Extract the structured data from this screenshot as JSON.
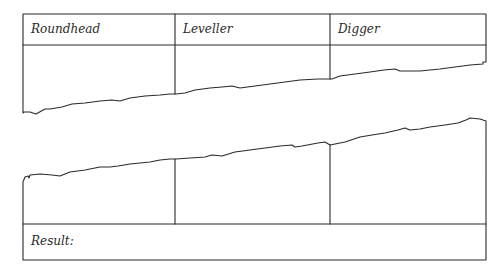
{
  "table": {
    "columns": [
      {
        "label": "Roundhead"
      },
      {
        "label": "Leveller"
      },
      {
        "label": "Digger"
      }
    ],
    "result_label": "Result:",
    "result_value": ""
  },
  "style": {
    "line_color": "#2a2a2a",
    "background": "#ffffff"
  }
}
